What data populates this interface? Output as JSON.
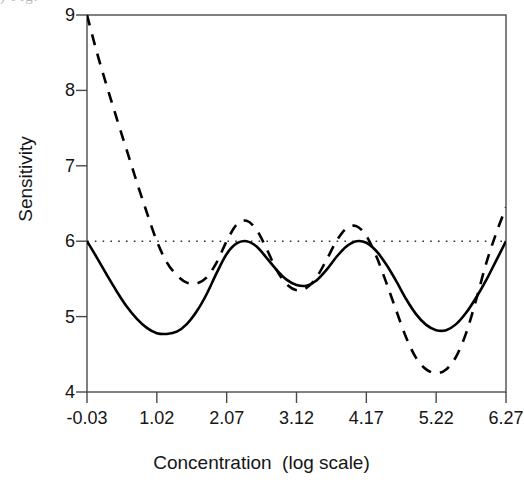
{
  "figure": {
    "caption_remnant": ")   Fig."
  },
  "chart_data": {
    "type": "line",
    "title": "",
    "xlabel": "Concentration  (log scale)",
    "ylabel": "Sensitivity",
    "xlim": [
      -0.03,
      6.27
    ],
    "ylim": [
      4,
      9
    ],
    "grid": false,
    "legend": "none",
    "xticks": [
      "-0.03",
      "1.02",
      "2.07",
      "3.12",
      "4.17",
      "5.22",
      "6.27"
    ],
    "xtick_values": [
      -0.03,
      1.02,
      2.07,
      3.12,
      4.17,
      5.22,
      6.27
    ],
    "yticks": [
      "4",
      "5",
      "6",
      "7",
      "8",
      "9"
    ],
    "ytick_values": [
      4,
      5,
      6,
      7,
      8,
      9
    ],
    "reference_line": {
      "name": "nominal-sensitivity",
      "orientation": "horizontal",
      "y": 6.0,
      "style": "dotted",
      "color": "#333333"
    },
    "series": [
      {
        "name": "Solid curve",
        "style": "solid",
        "color": "#000000",
        "x": [
          -0.03,
          0.12,
          0.27,
          0.42,
          0.57,
          0.72,
          0.87,
          1.02,
          1.17,
          1.32,
          1.47,
          1.62,
          1.77,
          1.92,
          2.07,
          2.22,
          2.37,
          2.52,
          2.67,
          2.82,
          2.97,
          3.12,
          3.27,
          3.42,
          3.57,
          3.72,
          3.87,
          4.02,
          4.17,
          4.32,
          4.47,
          4.62,
          4.77,
          4.92,
          5.07,
          5.22,
          5.37,
          5.52,
          5.67,
          5.82,
          5.97,
          6.12,
          6.27
        ],
        "y": [
          6.0,
          5.78,
          5.55,
          5.33,
          5.13,
          4.97,
          4.85,
          4.78,
          4.77,
          4.8,
          4.9,
          5.07,
          5.3,
          5.58,
          5.83,
          5.97,
          6.0,
          5.93,
          5.78,
          5.62,
          5.49,
          5.42,
          5.41,
          5.48,
          5.62,
          5.79,
          5.93,
          6.0,
          5.98,
          5.87,
          5.69,
          5.47,
          5.23,
          5.03,
          4.89,
          4.82,
          4.82,
          4.9,
          5.05,
          5.25,
          5.48,
          5.74,
          6.0
        ]
      },
      {
        "name": "Dashed curve",
        "style": "dashed",
        "color": "#000000",
        "x": [
          -0.03,
          0.12,
          0.27,
          0.42,
          0.57,
          0.72,
          0.87,
          1.02,
          1.17,
          1.32,
          1.47,
          1.62,
          1.77,
          1.92,
          2.07,
          2.22,
          2.37,
          2.52,
          2.67,
          2.82,
          2.97,
          3.12,
          3.27,
          3.42,
          3.57,
          3.72,
          3.87,
          4.02,
          4.17,
          4.32,
          4.47,
          4.62,
          4.77,
          4.92,
          5.07,
          5.22,
          5.37,
          5.52,
          5.67,
          5.82,
          5.97,
          6.12,
          6.27
        ],
        "y": [
          9.0,
          8.5,
          8.05,
          7.62,
          7.2,
          6.78,
          6.38,
          6.0,
          5.72,
          5.55,
          5.45,
          5.44,
          5.52,
          5.72,
          6.0,
          6.22,
          6.27,
          6.15,
          5.9,
          5.62,
          5.43,
          5.35,
          5.38,
          5.52,
          5.75,
          6.0,
          6.17,
          6.2,
          6.07,
          5.8,
          5.45,
          5.08,
          4.72,
          4.45,
          4.3,
          4.25,
          4.3,
          4.47,
          4.78,
          5.22,
          5.7,
          6.1,
          6.45
        ]
      }
    ]
  },
  "axes": {
    "frame": {
      "left": 87,
      "top": 15,
      "right": 506,
      "bottom": 392
    }
  }
}
